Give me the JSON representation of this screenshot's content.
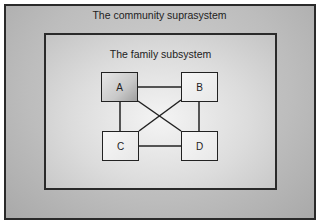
{
  "diagram": {
    "suprasystem": {
      "label": "The community suprasystem"
    },
    "subsystem": {
      "label": "The family subsystem"
    },
    "nodes": [
      {
        "id": "A",
        "label": "A"
      },
      {
        "id": "B",
        "label": "B"
      },
      {
        "id": "C",
        "label": "C"
      },
      {
        "id": "D",
        "label": "D"
      }
    ],
    "edges": [
      [
        "A",
        "B"
      ],
      [
        "C",
        "D"
      ],
      [
        "A",
        "C"
      ],
      [
        "B",
        "D"
      ],
      [
        "A",
        "D"
      ],
      [
        "B",
        "C"
      ]
    ],
    "colors": {
      "border": "#2a2a2a",
      "node_a_fill": "#b5b5b5",
      "node_fill": "#eeeeee"
    }
  }
}
